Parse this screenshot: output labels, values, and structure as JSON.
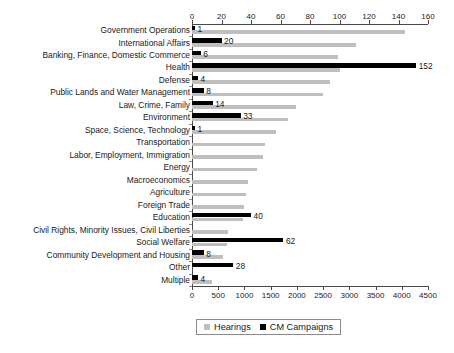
{
  "chart_data": {
    "type": "bar",
    "orientation": "horizontal",
    "title": "",
    "subtitle": "",
    "xlabel": "",
    "ylabel": "",
    "grid": false,
    "legend_position": "bottom-center",
    "categories": [
      "Government Operations",
      "International Affairs",
      "Banking, Finance, Domestic Commerce",
      "Health",
      "Defense",
      "Public Lands and Water Management",
      "Law, Crime, Family",
      "Environment",
      "Space, Science, Technology",
      "Transportation",
      "Labor, Employment, Immigration",
      "Energy",
      "Macroeconomics",
      "Agriculture",
      "Foreign Trade",
      "Education",
      "Civil Rights, Minority Issues, Civil Liberties",
      "Social Welfare",
      "Community Development and Housing",
      "Other",
      "Multiple"
    ],
    "series": [
      {
        "name": "Hearings",
        "color": "#bfbfbf",
        "axis": "bottom",
        "axis_range": [
          0,
          4500
        ],
        "axis_ticks": [
          0,
          500,
          1000,
          1500,
          2000,
          2500,
          3000,
          3500,
          4000,
          4500
        ],
        "values": [
          4060,
          3130,
          2780,
          2820,
          2630,
          2500,
          1980,
          1830,
          1600,
          1390,
          1350,
          1240,
          1070,
          1030,
          990,
          970,
          690,
          670,
          590,
          0,
          380
        ],
        "labels_shown": false
      },
      {
        "name": "CM Campaigns",
        "color": "#000000",
        "axis": "top",
        "axis_range": [
          0,
          160
        ],
        "axis_ticks": [
          0,
          20,
          40,
          60,
          80,
          100,
          120,
          140,
          160
        ],
        "values": [
          1,
          20,
          6,
          152,
          4,
          8,
          14,
          33,
          1,
          0,
          0,
          0,
          0,
          0,
          0,
          40,
          0,
          62,
          8,
          28,
          4
        ],
        "labels_shown": true,
        "labels": [
          "1",
          "20",
          "6",
          "152",
          "4",
          "8",
          "14",
          "33",
          "1",
          "",
          "",
          "",
          "",
          "",
          "",
          "40",
          "",
          "62",
          "8",
          "28",
          "4"
        ]
      }
    ]
  },
  "legend": {
    "items": [
      {
        "label": "Hearings",
        "color": "#bfbfbf"
      },
      {
        "label": "CM Campaigns",
        "color": "#000000"
      }
    ]
  }
}
